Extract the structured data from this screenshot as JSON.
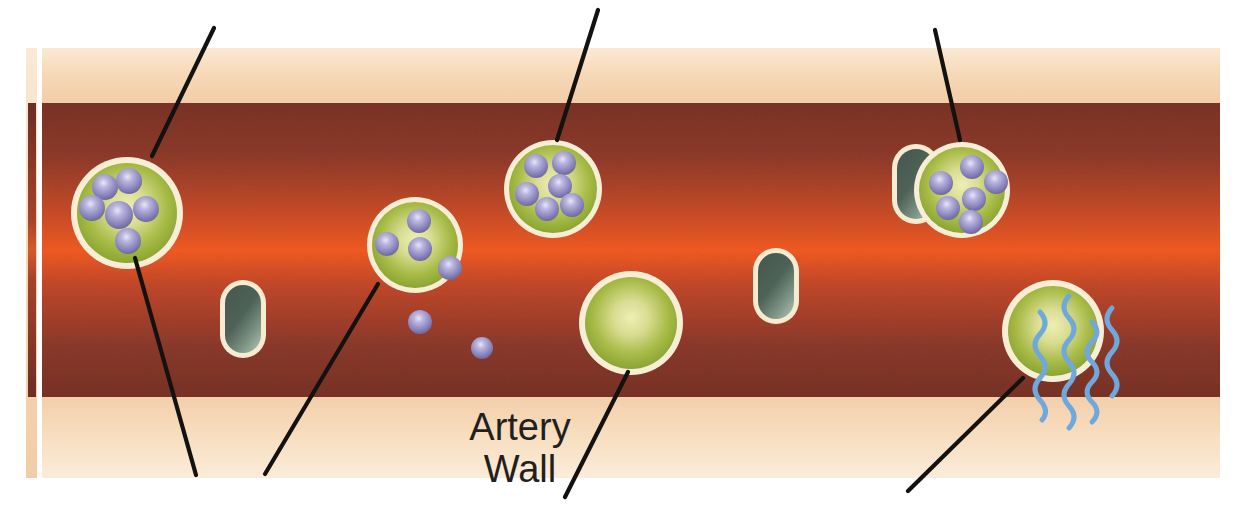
{
  "figure": {
    "title": "Artery Wall",
    "width": 1242,
    "height": 524,
    "background_color": "#ffffff"
  },
  "labels": {
    "artery_wall_line1": "Artery",
    "artery_wall_line2": "Wall",
    "artery_wall_x": 520,
    "artery_wall_line1_y": 440,
    "artery_wall_line2_y": 482
  },
  "colors": {
    "page_background": "#ffffff",
    "wall_band": "#f7dec1",
    "wall_band_edge": "#f3d0ad",
    "lumen_dark": "#7d3327",
    "lumen_mid": "#a8452f",
    "lumen_bright": "#f05a22",
    "cell_rim": "#f7ecd2",
    "cell_center": "#e7e7a8",
    "cell_edge": "#8aa62e",
    "granule_light": "#d8d4ee",
    "granule_mid": "#9a95c8",
    "granule_dark": "#6e6aa2",
    "bacterium_light": "#9fb0a4",
    "bacterium_dark": "#3e5449",
    "cytokine_blue": "#6fa8dc",
    "leader_line": "#141210"
  },
  "anatomy": {
    "left_strip": {
      "name": "artery-cross-section-strip",
      "x": 26,
      "wall_x": 26,
      "wall_width": 10,
      "lumen_x": 29,
      "lumen_width": 7,
      "top": 48,
      "bottom": 478,
      "lumen_top": 103,
      "lumen_bottom": 397
    },
    "main_vessel": {
      "name": "artery-longitudinal-section",
      "x": 42,
      "width": 1178,
      "top": 48,
      "bottom": 478,
      "lumen_top": 103,
      "lumen_bottom": 397
    }
  },
  "cells": [
    {
      "name": "macrophage-with-granules-left",
      "cx": 127,
      "cy": 213,
      "r": 53,
      "granule_count": 6,
      "granules": [
        {
          "cx": 105,
          "cy": 187,
          "r": 13
        },
        {
          "cx": 129,
          "cy": 181,
          "r": 13
        },
        {
          "cx": 92,
          "cy": 208,
          "r": 13
        },
        {
          "cx": 119,
          "cy": 215,
          "r": 14
        },
        {
          "cx": 146,
          "cy": 209,
          "r": 13
        },
        {
          "cx": 128,
          "cy": 241,
          "r": 13
        }
      ]
    },
    {
      "name": "macrophage-with-granules-top-center",
      "cx": 553,
      "cy": 189,
      "r": 46,
      "granule_count": 6,
      "granules": [
        {
          "cx": 536,
          "cy": 166,
          "r": 12
        },
        {
          "cx": 564,
          "cy": 163,
          "r": 12
        },
        {
          "cx": 560,
          "cy": 186,
          "r": 12
        },
        {
          "cx": 527,
          "cy": 194,
          "r": 12
        },
        {
          "cx": 547,
          "cy": 209,
          "r": 12
        },
        {
          "cx": 572,
          "cy": 205,
          "r": 12
        }
      ]
    },
    {
      "name": "macrophage-degranulating-mid-left",
      "cx": 415,
      "cy": 245,
      "r": 45,
      "granule_count": 4,
      "granules": [
        {
          "cx": 419,
          "cy": 221,
          "r": 12
        },
        {
          "cx": 387,
          "cy": 244,
          "r": 12
        },
        {
          "cx": 420,
          "cy": 249,
          "r": 12
        },
        {
          "cx": 451,
          "cy": 267,
          "r": 12
        }
      ]
    },
    {
      "name": "macrophage-with-granules-right",
      "cx": 962,
      "cy": 190,
      "r": 44,
      "granule_count": 6,
      "granules": [
        {
          "cx": 972,
          "cy": 167,
          "r": 12
        },
        {
          "cx": 941,
          "cy": 183,
          "r": 12
        },
        {
          "cx": 996,
          "cy": 182,
          "r": 12
        },
        {
          "cx": 974,
          "cy": 199,
          "r": 12
        },
        {
          "cx": 948,
          "cy": 208,
          "r": 12
        },
        {
          "cx": 971,
          "cy": 222,
          "r": 12
        }
      ]
    },
    {
      "name": "macrophage-empty-center",
      "cx": 631,
      "cy": 323,
      "r": 48,
      "granule_count": 0,
      "granules": []
    },
    {
      "name": "macrophage-signaling-bottom-right",
      "cx": 1053,
      "cy": 331,
      "r": 48,
      "granule_count": 0,
      "granules": []
    }
  ],
  "free_granules": [
    {
      "name": "free-granule-1",
      "cx": 450,
      "cy": 268,
      "r": 12
    },
    {
      "name": "free-granule-2",
      "cx": 420,
      "cy": 322,
      "r": 12
    },
    {
      "name": "free-granule-3",
      "cx": 482,
      "cy": 348,
      "r": 11
    }
  ],
  "bacteria": [
    {
      "name": "bacterium-left",
      "x": 222,
      "y": 282,
      "width": 42,
      "height": 74
    },
    {
      "name": "bacterium-engulfed-right",
      "x": 894,
      "y": 146,
      "width": 44,
      "height": 76
    },
    {
      "name": "bacterium-center-right",
      "x": 755,
      "y": 250,
      "width": 42,
      "height": 72
    }
  ],
  "cytokines": [
    {
      "name": "cytokine-wave-1",
      "x": 1040,
      "y_start": 310,
      "y_end": 420,
      "amplitude": 9,
      "waves": 5
    },
    {
      "name": "cytokine-wave-2",
      "x": 1068,
      "y_start": 296,
      "y_end": 440,
      "amplitude": 9,
      "waves": 6
    },
    {
      "name": "cytokine-wave-3",
      "x": 1093,
      "y_start": 322,
      "y_end": 425,
      "amplitude": 8,
      "waves": 5
    },
    {
      "name": "cytokine-wave-4",
      "x": 1107,
      "y_start": 308,
      "y_end": 398,
      "amplitude": 9,
      "waves": 4
    }
  ],
  "leader_lines": [
    {
      "name": "leader-line-top-left",
      "x1": 214,
      "y1": 28,
      "x2": 152,
      "y2": 156
    },
    {
      "name": "leader-line-top-center",
      "x1": 598,
      "y1": 10,
      "x2": 557,
      "y2": 140
    },
    {
      "name": "leader-line-top-right",
      "x1": 935,
      "y1": 30,
      "x2": 960,
      "y2": 140
    },
    {
      "name": "leader-line-bottom-left-1",
      "x1": 135,
      "y1": 258,
      "x2": 196,
      "y2": 475
    },
    {
      "name": "leader-line-bottom-left-2",
      "x1": 378,
      "y1": 284,
      "x2": 265,
      "y2": 474
    },
    {
      "name": "leader-line-bottom-center",
      "x1": 628,
      "y1": 372,
      "x2": 565,
      "y2": 497
    },
    {
      "name": "leader-line-bottom-right",
      "x1": 1023,
      "y1": 378,
      "x2": 908,
      "y2": 491
    }
  ]
}
